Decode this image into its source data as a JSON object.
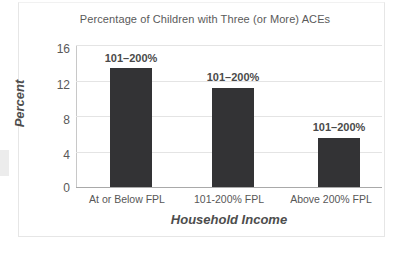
{
  "chart_data": {
    "type": "bar",
    "title": "Percentage of Children with Three (or More) ACEs",
    "xlabel": "Household Income",
    "ylabel": "Percent",
    "categories": [
      "At or Below FPL",
      "101-200% FPL",
      "Above 200% FPL"
    ],
    "values": [
      13.4,
      11.2,
      5.5
    ],
    "data_labels": [
      "101–200%",
      "101–200%",
      "101–200%"
    ],
    "ylim": [
      0,
      16
    ],
    "yticks": [
      "0",
      "4",
      "8",
      "12",
      "16"
    ],
    "ytick_values": [
      0,
      4,
      8,
      12,
      16
    ],
    "grid": true,
    "legend": false,
    "colors": {
      "bar": "#333335",
      "gridline": "#e4e4e4",
      "axis": "#a9a9a9",
      "title_text": "#5a5a5a",
      "tick_text": "#595959",
      "axis_title_text": "#4d4d4d",
      "data_label_text": "#4a4a4a",
      "background": "#ffffff",
      "frame": "#e6e6e6"
    }
  }
}
